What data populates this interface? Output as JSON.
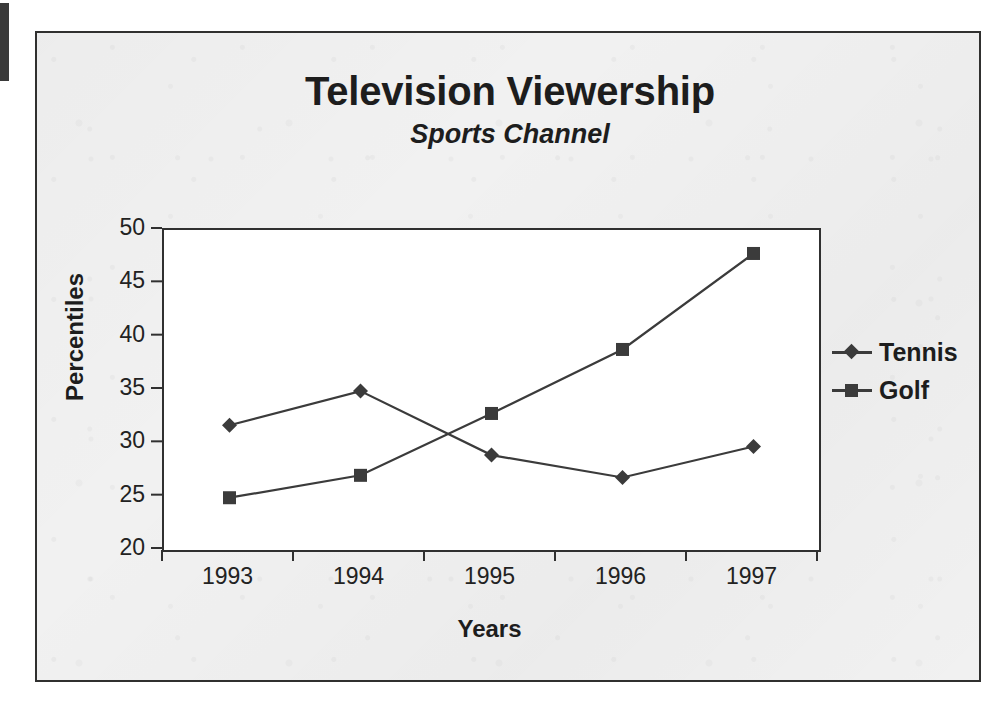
{
  "chart_data": {
    "type": "line",
    "title": "Television Viewership",
    "subtitle": "Sports Channel",
    "xlabel": "Years",
    "ylabel": "Percentiles",
    "categories": [
      "1993",
      "1994",
      "1995",
      "1996",
      "1997"
    ],
    "ylim": [
      20,
      50
    ],
    "y_ticks": [
      50,
      45,
      40,
      35,
      30,
      25,
      20
    ],
    "y_tick_labels": [
      "50",
      "45",
      "40",
      "35",
      "30",
      "25",
      "20"
    ],
    "grid": false,
    "legend_position": "right",
    "series": [
      {
        "name": "Tennis",
        "marker": "diamond",
        "color": "#3b3b3b",
        "values": [
          31.7,
          34.9,
          28.9,
          26.8,
          29.7
        ]
      },
      {
        "name": "Golf",
        "marker": "square",
        "color": "#3b3b3b",
        "values": [
          24.9,
          27.0,
          32.8,
          38.8,
          47.8
        ]
      }
    ]
  },
  "legend": {
    "items": [
      {
        "label": "Tennis",
        "marker": "diamond"
      },
      {
        "label": "Golf",
        "marker": "square"
      }
    ]
  },
  "colors": {
    "series": "#3b3b3b",
    "axis": "#303030",
    "text": "#1d1d1d",
    "plot_background": "#ffffff",
    "chart_background": "#f1f1f1"
  }
}
